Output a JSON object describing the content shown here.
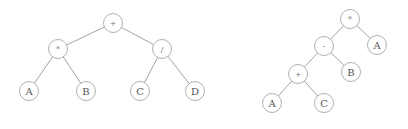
{
  "diagram": {
    "node_radius": 9.5,
    "colors": {
      "edge": "#9a9a9a",
      "node_stroke": "#a8a8a8",
      "label": "#555555"
    },
    "trees": [
      {
        "name": "left-tree",
        "expression": "(A * B) + (C / D)",
        "nodes": [
          {
            "id": "L1",
            "label": "+",
            "op": true,
            "x": 113,
            "y": 23
          },
          {
            "id": "L2",
            "label": "*",
            "op": true,
            "x": 58,
            "y": 49
          },
          {
            "id": "L3",
            "label": "/",
            "op": true,
            "x": 162,
            "y": 49
          },
          {
            "id": "L4",
            "label": "A",
            "op": false,
            "x": 29,
            "y": 91
          },
          {
            "id": "L5",
            "label": "B",
            "op": false,
            "x": 86,
            "y": 91
          },
          {
            "id": "L6",
            "label": "C",
            "op": false,
            "x": 140,
            "y": 91
          },
          {
            "id": "L7",
            "label": "D",
            "op": false,
            "x": 195,
            "y": 91
          }
        ],
        "edges": [
          [
            "L1",
            "L2"
          ],
          [
            "L1",
            "L3"
          ],
          [
            "L2",
            "L4"
          ],
          [
            "L2",
            "L5"
          ],
          [
            "L3",
            "L6"
          ],
          [
            "L3",
            "L7"
          ]
        ]
      },
      {
        "name": "right-tree",
        "expression": "((A + C) - B) * A",
        "nodes": [
          {
            "id": "R1",
            "label": "*",
            "op": true,
            "x": 350,
            "y": 19
          },
          {
            "id": "R2",
            "label": "-",
            "op": true,
            "x": 324,
            "y": 46
          },
          {
            "id": "R3",
            "label": "A",
            "op": false,
            "x": 377,
            "y": 45
          },
          {
            "id": "R4",
            "label": "+",
            "op": true,
            "x": 298,
            "y": 74
          },
          {
            "id": "R5",
            "label": "B",
            "op": false,
            "x": 351,
            "y": 72
          },
          {
            "id": "R6",
            "label": "A",
            "op": false,
            "x": 272,
            "y": 103
          },
          {
            "id": "R7",
            "label": "C",
            "op": false,
            "x": 324,
            "y": 103
          }
        ],
        "edges": [
          [
            "R1",
            "R2"
          ],
          [
            "R1",
            "R3"
          ],
          [
            "R2",
            "R4"
          ],
          [
            "R2",
            "R5"
          ],
          [
            "R4",
            "R6"
          ],
          [
            "R4",
            "R7"
          ]
        ]
      }
    ]
  }
}
